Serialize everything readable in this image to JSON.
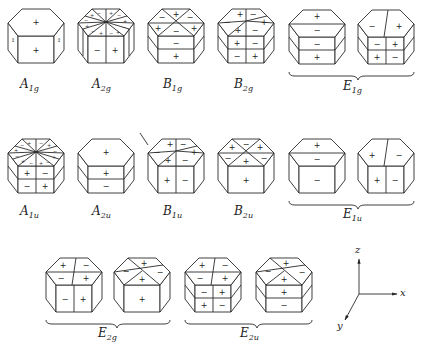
{
  "figure": {
    "rows": [
      {
        "items": [
          {
            "id": "A1g",
            "label_main": "A",
            "label_sub": "1g",
            "top": [
              "+"
            ],
            "front": [
              "+"
            ]
          },
          {
            "id": "A2g",
            "label_main": "A",
            "label_sub": "2g",
            "top": [
              "-",
              "+",
              "-",
              "+",
              "-",
              "+",
              "-",
              "+",
              "-",
              "+",
              "-",
              "+"
            ],
            "front": [
              "-",
              "+"
            ]
          },
          {
            "id": "B1g",
            "label_main": "B",
            "label_sub": "1g",
            "top": [
              "+",
              "-",
              "+",
              "-",
              "+",
              "-"
            ],
            "front": [
              "-",
              "+"
            ]
          },
          {
            "id": "B2g",
            "label_main": "B",
            "label_sub": "2g",
            "top": [
              "+",
              "-",
              "+",
              "-",
              "+",
              "-"
            ],
            "front": [
              "+",
              "-",
              "-",
              "+"
            ]
          },
          {
            "id": "E1g",
            "label_main": "E",
            "label_sub": "1g",
            "pair": true,
            "left": {
              "top": [
                "+",
                "-"
              ],
              "front": [
                "-",
                "+"
              ]
            },
            "right": {
              "top": [
                "-",
                "+"
              ],
              "front": [
                "-",
                "+",
                "+",
                "-"
              ]
            }
          }
        ]
      },
      {
        "items": [
          {
            "id": "A1u",
            "label_main": "A",
            "label_sub": "1u",
            "top": [
              "+",
              "-",
              "+",
              "-",
              "+",
              "-",
              "+",
              "-",
              "+",
              "-",
              "+",
              "-"
            ],
            "front": [
              "+",
              "-",
              "-",
              "+"
            ]
          },
          {
            "id": "A2u",
            "label_main": "A",
            "label_sub": "2u",
            "top": [
              "+"
            ],
            "front": [
              "+",
              "-"
            ]
          },
          {
            "id": "B1u",
            "label_main": "B",
            "label_sub": "1u",
            "top": [
              "+",
              "-",
              "+",
              "-",
              "+",
              "-"
            ],
            "front": [
              "+",
              "-"
            ]
          },
          {
            "id": "B2u",
            "label_main": "B",
            "label_sub": "2u",
            "top": [
              "-",
              "+",
              "-",
              "+",
              "-",
              "+"
            ],
            "front": [
              "+"
            ]
          },
          {
            "id": "E1u",
            "label_main": "E",
            "label_sub": "1u",
            "pair": true,
            "left": {
              "top": [
                "+",
                "-"
              ],
              "front": [
                "-"
              ]
            },
            "right": {
              "top": [
                "+",
                "-"
              ],
              "front": [
                "+",
                "-"
              ]
            }
          }
        ]
      },
      {
        "items": [
          {
            "id": "E2g",
            "label_main": "E",
            "label_sub": "2g",
            "pair": true,
            "left": {
              "top": [
                "+",
                "-",
                "-",
                "+"
              ],
              "front": [
                "-",
                "+"
              ]
            },
            "right": {
              "top": [
                "+",
                "-",
                "-",
                "+"
              ],
              "front": [
                "+"
              ]
            }
          },
          {
            "id": "E2u",
            "label_main": "E",
            "label_sub": "2u",
            "pair": true,
            "left": {
              "top": [
                "+",
                "-",
                "-",
                "+"
              ],
              "front": [
                "-",
                "+",
                "+",
                "-"
              ]
            },
            "right": {
              "top": [
                "+",
                "-",
                "-",
                "+"
              ],
              "front": [
                "+",
                "-"
              ]
            }
          }
        ]
      }
    ],
    "axes": {
      "z": "z",
      "x": "x",
      "y": "y"
    },
    "signs": {
      "plus": "+",
      "minus": "−"
    }
  }
}
